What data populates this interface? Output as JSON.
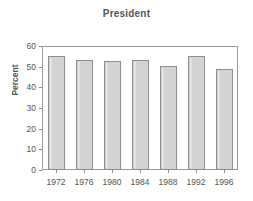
{
  "chart_data": {
    "type": "bar",
    "title": "President",
    "xlabel": "",
    "ylabel": "Percent",
    "categories": [
      "1972",
      "1976",
      "1980",
      "1984",
      "1988",
      "1992",
      "1996"
    ],
    "values": [
      55.2,
      53.4,
      52.6,
      53.1,
      50.1,
      55.1,
      48.8
    ],
    "ylim": [
      0,
      60
    ],
    "ytick_labels": [
      "0",
      "10",
      "20",
      "30",
      "40",
      "50",
      "60"
    ],
    "ytick_values": [
      0,
      10,
      20,
      30,
      40,
      50,
      60
    ],
    "grid": false,
    "legend": null,
    "series": [
      {
        "name": "Percent",
        "values": [
          55.2,
          53.4,
          52.6,
          53.1,
          50.1,
          55.1,
          48.8
        ]
      }
    ],
    "colors": {
      "bar_fill": "#d3d3d3",
      "bar_border": "#8f8f8f",
      "axis": "#9a9a9a",
      "text": "#555555",
      "background": "#ffffff"
    }
  }
}
